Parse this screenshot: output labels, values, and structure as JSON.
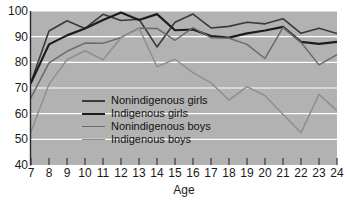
{
  "chart_data": {
    "type": "line",
    "title": "",
    "subtitle": "",
    "xlabel": "Age",
    "ylabel": "",
    "x": [
      7,
      8,
      9,
      10,
      11,
      12,
      13,
      14,
      15,
      16,
      17,
      18,
      19,
      20,
      21,
      22,
      23,
      24
    ],
    "xtick_labels": [
      "7",
      "8",
      "9",
      "10",
      "11",
      "12",
      "13",
      "14",
      "15",
      "16",
      "17",
      "18",
      "19",
      "20",
      "21",
      "22",
      "23",
      "24"
    ],
    "ytick_labels": [
      "40",
      "50",
      "60",
      "70",
      "80",
      "90",
      "100"
    ],
    "yticks": [
      40,
      50,
      60,
      70,
      80,
      90,
      100
    ],
    "xlim": [
      7,
      24
    ],
    "ylim": [
      40,
      100
    ],
    "grid": "horizontal-white",
    "legend_position": "center-left-inside",
    "plot_background": "#b2b2b2",
    "series": [
      {
        "name": "Nonindigenous girls",
        "color": "#3a3a3a",
        "width": 1.6,
        "values": [
          72.3,
          92.2,
          96.2,
          93.2,
          98.7,
          96.3,
          96.8,
          86.0,
          95.6,
          98.8,
          93.4,
          94.0,
          95.6,
          95.0,
          97.0,
          91.3,
          93.3,
          91.2
        ]
      },
      {
        "name": "Indigenous girls",
        "color": "#1c1c1c",
        "width": 2.2,
        "values": [
          72.0,
          87.0,
          90.5,
          93.2,
          96.5,
          99.4,
          96.5,
          98.8,
          92.5,
          92.8,
          90.2,
          89.6,
          91.3,
          92.4,
          93.8,
          88.0,
          87.2,
          88.0
        ]
      },
      {
        "name": "Nonindigenous boys",
        "color": "#6b6b6b",
        "width": 1.5,
        "values": [
          66.2,
          79.8,
          84.3,
          87.5,
          87.4,
          89.7,
          93.3,
          93.2,
          88.6,
          93.5,
          89.6,
          89.4,
          87.0,
          81.5,
          93.6,
          87.8,
          79.0,
          83.0
        ]
      },
      {
        "name": "Indigenous boys",
        "color": "#8f8f8f",
        "width": 1.5,
        "values": [
          53.0,
          71.5,
          81.0,
          84.5,
          81.0,
          89.6,
          93.4,
          78.3,
          81.2,
          76.0,
          72.0,
          65.3,
          70.5,
          67.0,
          59.8,
          52.6,
          67.5,
          61.2
        ]
      }
    ]
  },
  "legend": {
    "items": [
      {
        "label": "Nonindigenous girls"
      },
      {
        "label": "Indigenous girls"
      },
      {
        "label": "Nonindigenous boys"
      },
      {
        "label": "Indigenous boys"
      }
    ]
  }
}
